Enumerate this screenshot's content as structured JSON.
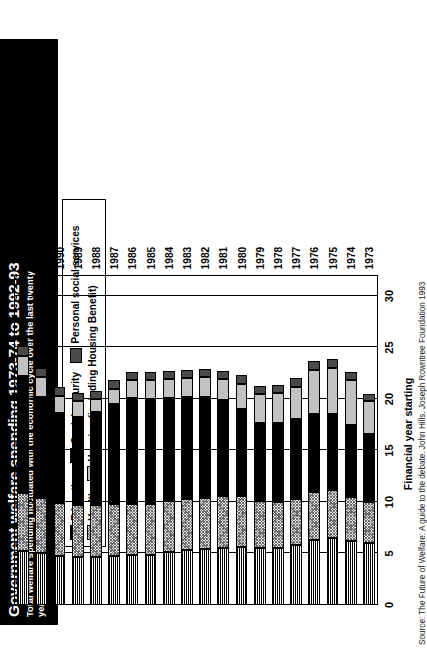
{
  "title": {
    "main": "Government welfare spending 1973-74 to 1992-93",
    "subtitle": "Total welfare spending fluctuated with the economic cycle over the last twenty years. The shares of health and social security grew."
  },
  "legend": {
    "row1": [
      {
        "label": "Education",
        "swatch": "education-swatch",
        "color": "#111111",
        "pattern": "horizontal-stripes"
      },
      {
        "label": "Social security",
        "swatch": "social-security-swatch",
        "color": "#000000",
        "pattern": "solid"
      },
      {
        "label": "Personal social services",
        "swatch": "personal-social-services-swatch",
        "color": "#4a4a4a",
        "pattern": "solid-dark-grey"
      }
    ],
    "row2": [
      {
        "label": "Health",
        "swatch": "health-swatch",
        "color": "#e9e9e9",
        "pattern": "fine-cross-hatch"
      },
      {
        "label": "Housing (including Housing Benefit)",
        "swatch": "housing-swatch",
        "color": "#c2c2c2",
        "pattern": "solid-light-grey"
      }
    ]
  },
  "axes": {
    "category_axis_title": "Financial year starting",
    "value_ticks": [
      "0",
      "5",
      "10",
      "15",
      "20",
      "25",
      "30"
    ]
  },
  "source": "Source: The Future of Welfare: A guide to the debate. John Hills. Joseph Rowntree Foundation 1993",
  "chart_data": {
    "type": "bar",
    "orientation": "horizontal-stacked",
    "title": "Government welfare spending 1973-74 to 1992-93",
    "xlabel": "Financial year starting",
    "ylabel": "",
    "ylim": [
      0,
      30
    ],
    "grid": true,
    "legend_position": "top",
    "stacked": true,
    "categories": [
      "1973",
      "1974",
      "1975",
      "1976",
      "1977",
      "1978",
      "1979",
      "1980",
      "1981",
      "1982",
      "1983",
      "1984",
      "1985",
      "1986",
      "1987",
      "1988",
      "1989",
      "1990",
      "1991",
      "1992"
    ],
    "series": [
      {
        "name": "Education",
        "color": "#111111",
        "values": [
          6.0,
          6.2,
          6.5,
          6.3,
          5.8,
          5.5,
          5.5,
          5.6,
          5.5,
          5.4,
          5.3,
          5.1,
          4.9,
          4.9,
          4.8,
          4.7,
          4.7,
          4.8,
          5.0,
          5.2
        ]
      },
      {
        "name": "Health",
        "color": "#e9e9e9",
        "values": [
          4.0,
          4.3,
          4.7,
          4.7,
          4.5,
          4.5,
          4.6,
          5.0,
          5.1,
          5.0,
          5.0,
          5.0,
          4.9,
          4.9,
          5.0,
          5.0,
          5.0,
          5.1,
          5.4,
          5.7
        ]
      },
      {
        "name": "Social security",
        "color": "#000000",
        "values": [
          6.6,
          7.0,
          7.3,
          7.5,
          7.8,
          7.7,
          7.6,
          8.4,
          9.3,
          9.8,
          9.9,
          10.0,
          10.2,
          10.3,
          9.7,
          9.0,
          8.6,
          8.7,
          9.8,
          11.3
        ]
      },
      {
        "name": "Housing (including Housing Benefit)",
        "color": "#c2c2c2",
        "values": [
          3.2,
          4.3,
          4.5,
          4.3,
          3.1,
          2.9,
          2.8,
          2.5,
          2.0,
          1.9,
          1.8,
          1.8,
          1.8,
          1.7,
          1.5,
          1.3,
          1.5,
          1.7,
          1.9,
          2.0
        ]
      },
      {
        "name": "Personal social services",
        "color": "#4a4a4a",
        "values": [
          0.7,
          0.8,
          0.9,
          0.9,
          0.8,
          0.8,
          0.8,
          0.8,
          0.8,
          0.8,
          0.8,
          0.8,
          0.8,
          0.8,
          0.8,
          0.8,
          0.8,
          0.9,
          0.9,
          0.9
        ]
      }
    ],
    "totals": [
      20.5,
      22.6,
      23.9,
      23.7,
      22.0,
      21.4,
      21.3,
      22.3,
      22.7,
      22.9,
      22.8,
      22.7,
      22.6,
      22.6,
      21.8,
      20.8,
      20.6,
      21.2,
      23.0,
      25.1
    ]
  }
}
